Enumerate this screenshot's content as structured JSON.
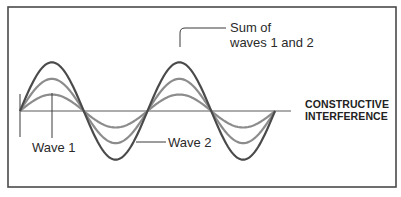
{
  "labels": {
    "title_line1": "CONSTRUCTIVE",
    "title_line2": "INTERFERENCE",
    "sum_line1": "Sum of",
    "sum_line2": "waves 1 and 2",
    "wave1": "Wave 1",
    "wave2": "Wave 2"
  },
  "colors": {
    "frame": "#4a4a4a",
    "axis": "#5a5a5a",
    "sum_wave": "#4a4a4a",
    "wave2": "#8c8c8c",
    "wave1": "#8c8c8c",
    "leader": "#3a3a3a"
  },
  "chart_data": {
    "type": "line",
    "xlabel": "",
    "ylabel": "",
    "grid": false,
    "cycles": 2,
    "series": [
      {
        "name": "Wave 1",
        "amplitude": 1.0,
        "phase": 0
      },
      {
        "name": "Wave 2",
        "amplitude": 1.95,
        "phase": 0
      },
      {
        "name": "Sum of waves 1 and 2",
        "amplitude": 2.95,
        "phase": 0
      }
    ],
    "annotations": [
      "Sum of waves 1 and 2",
      "Wave 1",
      "Wave 2",
      "CONSTRUCTIVE INTERFERENCE"
    ]
  }
}
